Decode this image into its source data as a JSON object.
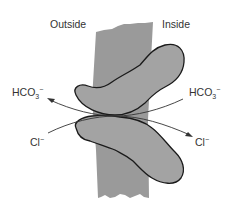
{
  "diagram": {
    "regions": {
      "outside_label": "Outside",
      "inside_label": "Inside"
    },
    "ions": {
      "left_top": {
        "base": "HCO",
        "subscript": "3",
        "superscript": "−"
      },
      "right_top": {
        "base": "HCO",
        "subscript": "3",
        "superscript": "−"
      },
      "left_bottom": {
        "base": "Cl",
        "superscript": "−"
      },
      "right_bottom": {
        "base": "Cl",
        "superscript": "−"
      }
    },
    "colors": {
      "membrane": "#9a9a9a",
      "protein": "#a3a3a3",
      "outline": "#1a1a1a",
      "text": "#333333"
    }
  }
}
